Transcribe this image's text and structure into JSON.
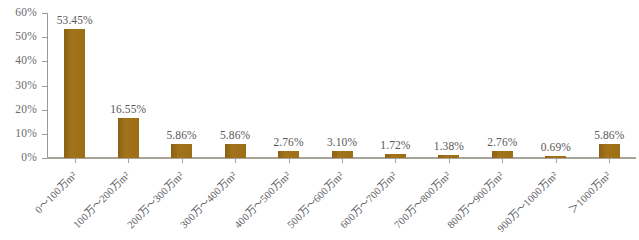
{
  "chart_data": {
    "type": "bar",
    "title": "",
    "subtitle": "",
    "xlabel": "",
    "ylabel": "",
    "ylim": [
      0,
      60
    ],
    "y_tick_labels": [
      "0%",
      "10%",
      "20%",
      "30%",
      "40%",
      "50%",
      "60%"
    ],
    "y_ticks": [
      0,
      10,
      20,
      30,
      40,
      50,
      60
    ],
    "grid": false,
    "legend": false,
    "legend_position": "none",
    "bar_color": "#9c6e15",
    "label_color": "#58585a",
    "axis_color": "#a8a49c",
    "background_color": "#ffffff",
    "categories": [
      "0～100万m²",
      "100万～200万m²",
      "200万～300万m²",
      "300万～400万m²",
      "400万～500万m²",
      "500万～600万m²",
      "600万～700万m²",
      "700万～800万m²",
      "800万～900万m²",
      "900万～1000万m²",
      "＞1000万m²"
    ],
    "values": [
      53.45,
      16.55,
      5.86,
      5.86,
      2.76,
      3.1,
      1.72,
      1.38,
      2.76,
      0.69,
      5.86
    ],
    "data_labels": [
      "53.45%",
      "16.55%",
      "5.86%",
      "5.86%",
      "2.76%",
      "3.10%",
      "1.72%",
      "1.38%",
      "2.76%",
      "0.69%",
      "5.86%"
    ]
  }
}
